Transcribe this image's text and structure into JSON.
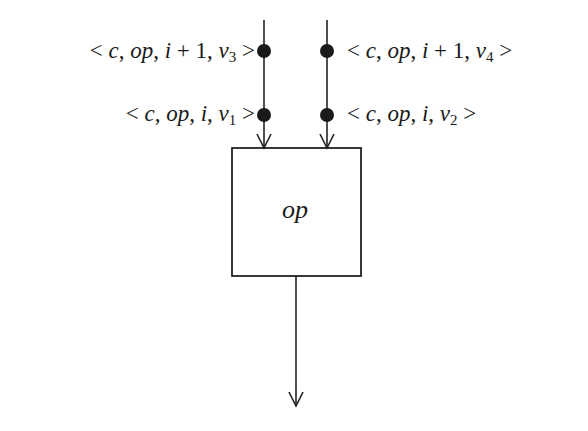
{
  "diagram": {
    "type": "dataflow-operator",
    "colors": {
      "stroke": "#222222",
      "token": "#1a1a1a",
      "background": "#ffffff"
    },
    "operator_box": {
      "label": "op"
    },
    "inputs": [
      {
        "arc": "left",
        "tokens": [
          {
            "position": "top",
            "text": "< c, op, i + 1, v3 >",
            "parts": [
              "< ",
              "c",
              ", ",
              "op",
              ", ",
              "i",
              " + 1, ",
              "v",
              "3",
              " >"
            ]
          },
          {
            "position": "bottom",
            "text": "< c, op, i, v1 >",
            "parts": [
              "< ",
              "c",
              ", ",
              "op",
              ", ",
              "i",
              ", ",
              "v",
              "1",
              " >"
            ]
          }
        ]
      },
      {
        "arc": "right",
        "tokens": [
          {
            "position": "top",
            "text": "< c, op, i + 1, v4 >",
            "parts": [
              "< ",
              "c",
              ", ",
              "op",
              ", ",
              "i",
              " + 1, ",
              "v",
              "4",
              " >"
            ]
          },
          {
            "position": "bottom",
            "text": "< c, op, i, v2 >",
            "parts": [
              "< ",
              "c",
              ", ",
              "op",
              ", ",
              "i",
              ", ",
              "v",
              "2",
              " >"
            ]
          }
        ]
      }
    ],
    "output": {
      "arc": "bottom"
    }
  }
}
